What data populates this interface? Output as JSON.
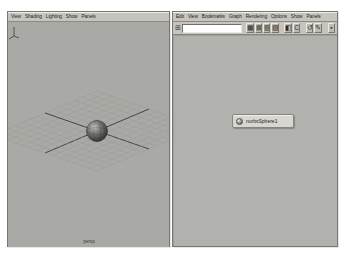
{
  "left_panel": {
    "title": "perspective-view",
    "menus": [
      {
        "label": "View"
      },
      {
        "label": "Shading"
      },
      {
        "label": "Lighting"
      },
      {
        "label": "Show"
      },
      {
        "label": "Panels"
      }
    ],
    "camera_label": "persp"
  },
  "right_panel": {
    "title": "hypergraph",
    "menus": [
      {
        "label": "Edit"
      },
      {
        "label": "View"
      },
      {
        "label": "Bookmarks"
      },
      {
        "label": "Graph"
      },
      {
        "label": "Rendering"
      },
      {
        "label": "Options"
      },
      {
        "label": "Show"
      },
      {
        "label": "Panels"
      }
    ],
    "toolbar": {
      "lead_icon_glyph": "⊞",
      "search_value": "",
      "icons": [
        {
          "name": "scene-hierarchy-icon",
          "glyph": "▦"
        },
        {
          "name": "input-output-connections-icon",
          "glyph": "▤"
        },
        {
          "name": "upstream-connections-icon",
          "glyph": "▧"
        },
        {
          "name": "downstream-connections-icon",
          "glyph": "▨"
        },
        {
          "name": "freeform-layout-icon",
          "glyph": "◧"
        },
        {
          "name": "automatic-layout-icon",
          "glyph": "C"
        },
        {
          "name": "cycle-layout-icon",
          "glyph": "↺"
        },
        {
          "name": "rearrange-graph-icon",
          "glyph": "✎"
        },
        {
          "name": "graph-filter-icon",
          "glyph": "▪"
        }
      ]
    },
    "node": {
      "label": "nurbsSphere1"
    }
  },
  "colors": {
    "viewport_bg": "#a9a9a5",
    "canvas_bg": "#b1b1ad",
    "menubar_bg": "#c7c4be",
    "node_bg": "#d9d6d0",
    "axis_line": "#454543",
    "grid_line": "#9b9b97"
  }
}
